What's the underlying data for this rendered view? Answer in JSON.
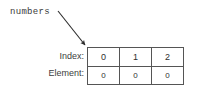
{
  "diagram": {
    "variable_label": "numbers",
    "pointer": {
      "icon": "arrow-icon",
      "from_x": 58,
      "from_y": 11,
      "to_x": 87,
      "to_y": 47,
      "color": "#2b2b2b"
    },
    "row_labels": {
      "index": "Index:",
      "element": "Element:"
    },
    "table": {
      "index_row": [
        "0",
        "1",
        "2"
      ],
      "element_row": [
        "0",
        "0",
        "0"
      ],
      "border_color": "#555555",
      "cell_background": "#ffffff",
      "text_color": "#2f2f2f"
    }
  }
}
